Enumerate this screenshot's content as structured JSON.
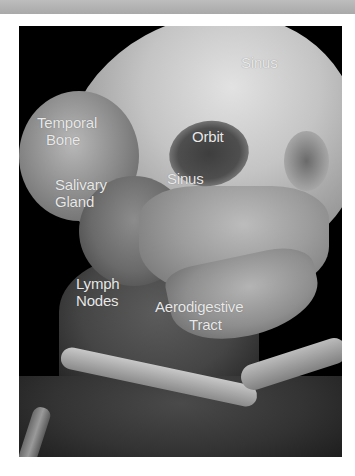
{
  "image": {
    "description": "3D volume-rendered CT of head and neck, lateral oblique view",
    "background_color": "#000000",
    "label_color": "#e9e9e9"
  },
  "labels": {
    "sinus_top": "Sinus",
    "temporal_bone": [
      "Temporal",
      "Bone"
    ],
    "orbit": "Orbit",
    "sinus_lower": "Sinus",
    "salivary_gland": [
      "Salivary",
      "Gland"
    ],
    "lymph_nodes": [
      "Lymph",
      "Nodes"
    ],
    "aerodigestive_tract": [
      "Aerodigestive",
      "Tract"
    ]
  }
}
